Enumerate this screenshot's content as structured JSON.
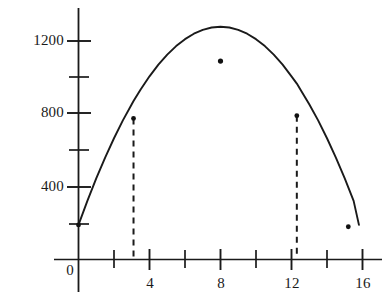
{
  "chart_data": {
    "type": "line",
    "title": "",
    "subtitle": "",
    "xlabel": "",
    "ylabel": "",
    "xlim": [
      0,
      16.6
    ],
    "ylim": [
      0,
      1320
    ],
    "grid": false,
    "legend": "none",
    "curve_description": "Downward-opening parabola (projectile arc) rising from about 190 at x=0, peaking near 1090 at x=8, and returning to 0 near x=15.8",
    "equation_estimate": "y = -17x^2 + 272x + 190",
    "x_axis": {
      "major_ticks": [
        0,
        4,
        8,
        12,
        16
      ],
      "major_tick_labels": [
        "0",
        "4",
        "8",
        "12",
        "16"
      ],
      "minor_ticks": [
        2,
        6,
        10,
        14
      ]
    },
    "y_axis": {
      "major_ticks": [
        400,
        800,
        1200
      ],
      "major_tick_labels": [
        "400",
        "800",
        "1200"
      ],
      "minor_ticks": [
        200,
        600,
        1000
      ]
    },
    "series": [
      {
        "name": "curve",
        "style": "solid",
        "color": "#1a1a1a",
        "x": [
          0,
          0.5,
          1,
          1.5,
          2,
          2.5,
          3,
          3.1,
          3.5,
          4,
          4.5,
          5,
          5.5,
          6,
          6.5,
          7,
          7.5,
          8,
          8.5,
          9,
          9.5,
          10,
          10.5,
          11,
          11.5,
          12,
          12.3,
          12.5,
          13,
          13.5,
          14,
          14.5,
          15,
          15.2,
          15.5,
          15.8
        ],
        "y": [
          190,
          322,
          445,
          560,
          666,
          764,
          853,
          870,
          934,
          1006,
          1070,
          1125,
          1172,
          1210,
          1240,
          1261,
          1274,
          1278,
          1274,
          1261,
          1240,
          1210,
          1172,
          1125,
          1070,
          1006,
          966,
          934,
          853,
          764,
          666,
          560,
          445,
          396,
          322,
          190
        ]
      }
    ],
    "markers": [
      {
        "name": "launch-point",
        "x": 0,
        "y": 190,
        "label": ""
      },
      {
        "name": "left-dashed-point",
        "x": 3.1,
        "y": 775,
        "label": ""
      },
      {
        "name": "vertex-point",
        "x": 8,
        "y": 1090,
        "label": ""
      },
      {
        "name": "right-dashed-point",
        "x": 12.3,
        "y": 790,
        "label": ""
      },
      {
        "name": "descent-point",
        "x": 15.2,
        "y": 180,
        "label": ""
      }
    ],
    "dropline_segments": [
      {
        "name": "left-dropline",
        "x": 3.1,
        "y_top": 775,
        "y_bottom": 0,
        "style": "dashed"
      },
      {
        "name": "right-dropline",
        "x": 12.3,
        "y_top": 790,
        "y_bottom": 0,
        "style": "dashed"
      }
    ],
    "colors": {
      "curve": "#1a1a1a",
      "axis": "#1a1a1a",
      "dashed": "#1a1a1a",
      "marker": "#111111",
      "background": "#ffffff",
      "text": "#1a1a1a"
    }
  }
}
